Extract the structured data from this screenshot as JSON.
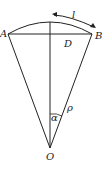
{
  "diagram": {
    "type": "circular sector with chord",
    "points": {
      "A": {
        "label": "A",
        "x": 8,
        "y": 34
      },
      "B": {
        "label": "B",
        "x": 92,
        "y": 34
      },
      "D": {
        "label": "D",
        "x": 50,
        "y": 34
      },
      "O": {
        "label": "O",
        "x": 50,
        "y": 148
      }
    },
    "labels": {
      "arc_length": "l",
      "radius": "ρ",
      "angle": "α",
      "A": "A",
      "B": "B",
      "D": "D",
      "O": "O"
    },
    "colors": {
      "stroke": "#222222",
      "background": "#ffffff"
    }
  }
}
